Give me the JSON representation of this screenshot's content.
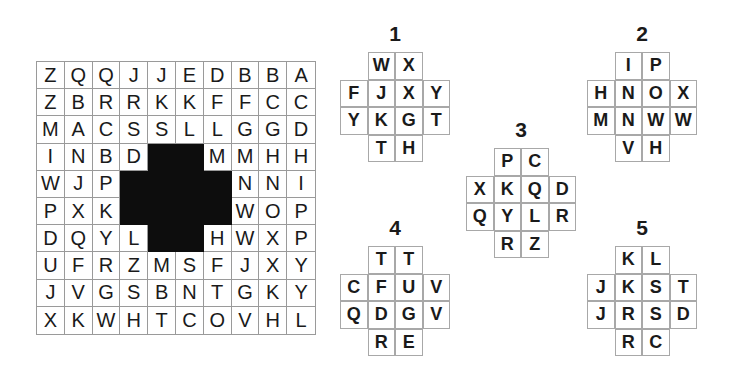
{
  "grid": {
    "rows": [
      [
        "Z",
        "Q",
        "Q",
        "J",
        "J",
        "E",
        "D",
        "B",
        "B",
        "A"
      ],
      [
        "Z",
        "B",
        "R",
        "R",
        "K",
        "K",
        "F",
        "F",
        "C",
        "C"
      ],
      [
        "M",
        "A",
        "C",
        "S",
        "S",
        "L",
        "L",
        "G",
        "G",
        "D"
      ],
      [
        "I",
        "N",
        "B",
        "D",
        "",
        "",
        "M",
        "M",
        "H",
        "H"
      ],
      [
        "W",
        "J",
        "P",
        "",
        "",
        "",
        "",
        "N",
        "N",
        "I"
      ],
      [
        "P",
        "X",
        "K",
        "",
        "",
        "",
        "",
        "W",
        "O",
        "P"
      ],
      [
        "D",
        "Q",
        "Y",
        "L",
        "",
        "",
        "H",
        "W",
        "X",
        "P"
      ],
      [
        "U",
        "F",
        "R",
        "Z",
        "M",
        "S",
        "F",
        "J",
        "X",
        "Y"
      ],
      [
        "J",
        "V",
        "G",
        "S",
        "B",
        "N",
        "T",
        "G",
        "K",
        "Y"
      ],
      [
        "X",
        "K",
        "W",
        "H",
        "T",
        "C",
        "O",
        "V",
        "H",
        "L"
      ]
    ],
    "hole_cells": [
      [
        3,
        4
      ],
      [
        3,
        5
      ],
      [
        4,
        3
      ],
      [
        4,
        4
      ],
      [
        4,
        5
      ],
      [
        4,
        6
      ],
      [
        5,
        3
      ],
      [
        5,
        4
      ],
      [
        5,
        5
      ],
      [
        5,
        6
      ],
      [
        6,
        4
      ],
      [
        6,
        5
      ]
    ]
  },
  "pieces": [
    {
      "number": "1",
      "x": 340,
      "y": 52,
      "cells": [
        "W",
        "X",
        "F",
        "J",
        "X",
        "Y",
        "Y",
        "K",
        "G",
        "T",
        "T",
        "H"
      ]
    },
    {
      "number": "2",
      "x": 587,
      "y": 52,
      "cells": [
        "I",
        "P",
        "H",
        "N",
        "O",
        "X",
        "M",
        "N",
        "W",
        "W",
        "V",
        "H"
      ]
    },
    {
      "number": "3",
      "x": 466,
      "y": 148,
      "cells": [
        "P",
        "C",
        "X",
        "K",
        "Q",
        "D",
        "Q",
        "Y",
        "L",
        "R",
        "R",
        "Z"
      ]
    },
    {
      "number": "4",
      "x": 340,
      "y": 246,
      "cells": [
        "T",
        "T",
        "C",
        "F",
        "U",
        "V",
        "Q",
        "D",
        "G",
        "V",
        "R",
        "E"
      ]
    },
    {
      "number": "5",
      "x": 587,
      "y": 246,
      "cells": [
        "K",
        "L",
        "J",
        "K",
        "S",
        "T",
        "J",
        "R",
        "S",
        "D",
        "R",
        "C"
      ]
    }
  ],
  "piece_shape": [
    [
      0,
      1
    ],
    [
      0,
      2
    ],
    [
      1,
      0
    ],
    [
      1,
      1
    ],
    [
      1,
      2
    ],
    [
      1,
      3
    ],
    [
      2,
      0
    ],
    [
      2,
      1
    ],
    [
      2,
      2
    ],
    [
      2,
      3
    ],
    [
      3,
      1
    ],
    [
      3,
      2
    ]
  ]
}
